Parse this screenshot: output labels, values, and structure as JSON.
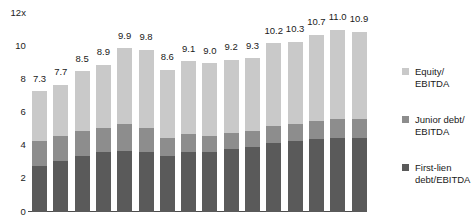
{
  "chart_data": {
    "type": "bar",
    "stacked": true,
    "title": "",
    "xlabel": "",
    "ylabel": "",
    "ylim": [
      0,
      12
    ],
    "yticks": [
      "12x",
      "10",
      "8",
      "6",
      "4",
      "2",
      "0"
    ],
    "grid": false,
    "legend_position": "right",
    "categories": [
      "1",
      "2",
      "3",
      "4",
      "5",
      "6",
      "7",
      "8",
      "9",
      "10",
      "11",
      "12",
      "13",
      "14",
      "15",
      "16"
    ],
    "totals": [
      7.3,
      7.7,
      8.5,
      8.9,
      9.9,
      9.8,
      8.6,
      9.1,
      9.0,
      9.2,
      9.3,
      10.2,
      10.3,
      10.7,
      11.0,
      10.9
    ],
    "total_labels": [
      "7.3",
      "7.7",
      "8.5",
      "8.9",
      "9.9",
      "9.8",
      "8.6",
      "9.1",
      "9.0",
      "9.2",
      "9.3",
      "10.2",
      "10.3",
      "10.7",
      "11.0",
      "10.9"
    ],
    "series": [
      {
        "name": "First-lien debt/EBITDA",
        "color": "#5a5a5a",
        "values": [
          2.8,
          3.1,
          3.4,
          3.6,
          3.7,
          3.6,
          3.4,
          3.6,
          3.6,
          3.8,
          3.9,
          4.2,
          4.3,
          4.4,
          4.5,
          4.5
        ]
      },
      {
        "name": "Junior debt/EBITDA",
        "color": "#8d8d8d",
        "values": [
          1.5,
          1.5,
          1.5,
          1.5,
          1.6,
          1.5,
          1.1,
          1.1,
          1.0,
          1.0,
          1.0,
          1.0,
          1.0,
          1.1,
          1.1,
          1.1
        ]
      },
      {
        "name": "Equity/EBITDA",
        "color": "#c9c9c9",
        "values": [
          3.0,
          3.1,
          3.6,
          3.8,
          4.6,
          4.7,
          4.1,
          4.4,
          4.4,
          4.4,
          4.4,
          5.0,
          5.0,
          5.2,
          5.4,
          5.3
        ]
      }
    ]
  },
  "axis": {
    "y_ticks": [
      {
        "label": "12x",
        "value": 12
      },
      {
        "label": "10",
        "value": 10
      },
      {
        "label": "8",
        "value": 8
      },
      {
        "label": "6",
        "value": 6
      },
      {
        "label": "4",
        "value": 4
      },
      {
        "label": "2",
        "value": 2
      },
      {
        "label": "0",
        "value": 0
      }
    ]
  },
  "legend": {
    "items": [
      {
        "line1": "Equity/",
        "line2": "EBITDA",
        "color": "#c9c9c9",
        "key": "equity"
      },
      {
        "line1": "Junior debt/",
        "line2": "EBITDA",
        "color": "#8d8d8d",
        "key": "junior"
      },
      {
        "line1": "First-lien",
        "line2": "debt/EBITDA",
        "color": "#5a5a5a",
        "key": "first-lien"
      }
    ]
  },
  "title_remnant": ""
}
